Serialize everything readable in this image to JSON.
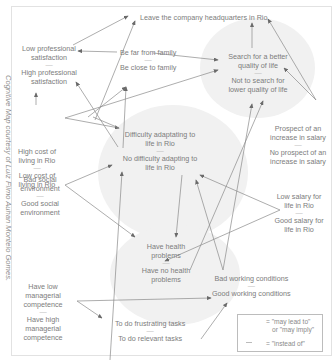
{
  "caption": "Cognitive Map courtesy of Luiz Filmo Auhan Montelo Gomes.",
  "nodes": {
    "leave": {
      "a": "Leave the company headquarters in Rio"
    },
    "prof": {
      "a": "Low professional satisfaction",
      "b": "High professional satisfaction"
    },
    "family": {
      "a": "Be far from family",
      "b": "Be close to family"
    },
    "quality": {
      "a": "Search for a better quality of life",
      "b": "Not to search for lower quality of life"
    },
    "cost": {
      "a": "High cost of living in Rio",
      "b": "Low cost of living in Rio"
    },
    "social": {
      "a": "Bad social environment",
      "b": "Good social environment"
    },
    "adapt": {
      "a": "Difficulty adaptating to life in Rio",
      "b": "No difficulty adapting to life in Rio"
    },
    "prospect": {
      "a": "Prospect of an increase in salary",
      "b": "No prospect of an increase in salary"
    },
    "salary": {
      "a": "Low salary for life in Rio",
      "b": "Good salary for life in Rio"
    },
    "health": {
      "a": "Have health problems",
      "b": "Have no health problems"
    },
    "working": {
      "a": "Bad working conditions",
      "b": "Good working conditions"
    },
    "managerial": {
      "a": "Have low managerial competence",
      "b": "Have high managerial competence"
    },
    "tasks": {
      "a": "To do frustrating tasks",
      "b": "To do relevant tasks"
    }
  },
  "separator": "—",
  "legend": {
    "arrow_line1": "= \"may lead to\"",
    "arrow_line2": "or \"may imply\"",
    "dash_label": "= \"instead of\""
  },
  "colors": {
    "text": "#7c7c7c",
    "line": "#8a8a8a",
    "blob": "#f1f1f1",
    "border": "#e2e2e2"
  }
}
